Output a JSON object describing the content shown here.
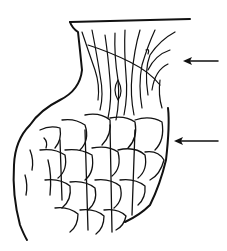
{
  "figure": {
    "type": "line-drawing",
    "background": "#ffffff",
    "ink_color": "#111111",
    "arrows": [
      {
        "id": "upper-arrow",
        "direction": "left",
        "tip": [
          183,
          61
        ],
        "tail": [
          218,
          61
        ]
      },
      {
        "id": "lower-arrow",
        "direction": "left",
        "tip": [
          174,
          141
        ],
        "tail": [
          218,
          141
        ]
      }
    ]
  }
}
